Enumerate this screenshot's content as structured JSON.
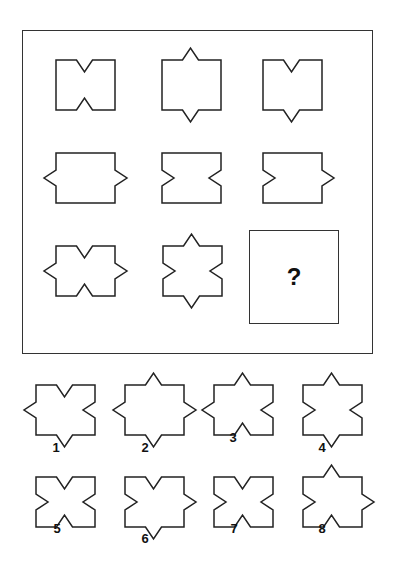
{
  "puzzle": {
    "question_mark": "?",
    "box": {
      "w": 59,
      "h": 50
    },
    "notch": {
      "w": 16,
      "d": 12
    },
    "stroke": "#222222",
    "grid": [
      {
        "id": "r1c1",
        "x": 56,
        "y": 60,
        "top": "in",
        "bottom": "in",
        "left": "none",
        "right": "none"
      },
      {
        "id": "r1c2",
        "x": 162,
        "y": 60,
        "top": "out",
        "bottom": "out",
        "left": "none",
        "right": "none"
      },
      {
        "id": "r1c3",
        "x": 263,
        "y": 60,
        "top": "in",
        "bottom": "out",
        "left": "none",
        "right": "none"
      },
      {
        "id": "r2c1",
        "x": 56,
        "y": 153,
        "top": "none",
        "bottom": "none",
        "left": "out",
        "right": "out"
      },
      {
        "id": "r2c2",
        "x": 162,
        "y": 153,
        "top": "none",
        "bottom": "none",
        "left": "in",
        "right": "in"
      },
      {
        "id": "r2c3",
        "x": 263,
        "y": 153,
        "top": "none",
        "bottom": "none",
        "left": "in",
        "right": "out"
      },
      {
        "id": "r3c1",
        "x": 56,
        "y": 246,
        "top": "in",
        "bottom": "in",
        "left": "out",
        "right": "out"
      },
      {
        "id": "r3c2",
        "x": 163,
        "y": 246,
        "top": "out",
        "bottom": "out",
        "left": "in",
        "right": "in"
      }
    ],
    "options": [
      {
        "label": "1",
        "x": 36,
        "y": 385,
        "lx": 56,
        "ly": 450,
        "top": "in",
        "bottom": "out",
        "left": "out",
        "right": "in"
      },
      {
        "label": "2",
        "x": 125,
        "y": 385,
        "lx": 145,
        "ly": 450,
        "top": "out",
        "bottom": "out",
        "left": "out",
        "right": "out"
      },
      {
        "label": "3",
        "x": 214,
        "y": 385,
        "lx": 233,
        "ly": 440,
        "top": "out",
        "bottom": "in",
        "left": "out",
        "right": "in"
      },
      {
        "label": "4",
        "x": 303,
        "y": 385,
        "lx": 322,
        "ly": 450,
        "top": "out",
        "bottom": "out",
        "left": "in",
        "right": "in"
      },
      {
        "label": "5",
        "x": 36,
        "y": 477,
        "lx": 57,
        "ly": 531,
        "top": "in",
        "bottom": "in",
        "left": "in",
        "right": "in"
      },
      {
        "label": "6",
        "x": 125,
        "y": 477,
        "lx": 145,
        "ly": 541,
        "top": "in",
        "bottom": "out",
        "left": "in",
        "right": "out"
      },
      {
        "label": "7",
        "x": 214,
        "y": 477,
        "lx": 234,
        "ly": 531,
        "top": "in",
        "bottom": "in",
        "left": "in",
        "right": "in"
      },
      {
        "label": "8",
        "x": 303,
        "y": 477,
        "lx": 322,
        "ly": 531,
        "top": "out",
        "bottom": "in",
        "left": "in",
        "right": "out"
      }
    ]
  }
}
